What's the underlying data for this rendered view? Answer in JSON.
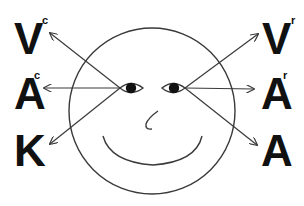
{
  "diagram": {
    "colors": {
      "ink": "#111111",
      "line": "#3a3a3a",
      "background": "#ffffff"
    },
    "left_labels": [
      {
        "letter": "V",
        "sup": "c"
      },
      {
        "letter": "A",
        "sup": "c"
      },
      {
        "letter": "K",
        "sup": ""
      }
    ],
    "right_labels": [
      {
        "letter": "V",
        "sup": "r"
      },
      {
        "letter": "A",
        "sup": "r"
      },
      {
        "letter": "A",
        "sup": ""
      }
    ],
    "face": {
      "shape": "circle",
      "features": [
        "left-eye",
        "right-eye",
        "nose",
        "smile"
      ]
    },
    "arrows": [
      {
        "from": "left-eye",
        "to": "V-c"
      },
      {
        "from": "left-eye",
        "to": "A-c"
      },
      {
        "from": "left-eye",
        "to": "K"
      },
      {
        "from": "right-eye",
        "to": "V-r"
      },
      {
        "from": "right-eye",
        "to": "A-r"
      },
      {
        "from": "right-eye",
        "to": "A"
      }
    ]
  }
}
